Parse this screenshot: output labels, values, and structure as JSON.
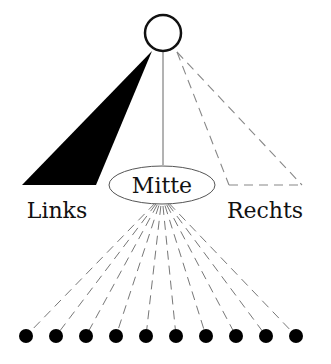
{
  "diagram": {
    "root": {
      "cx": 163,
      "cy": 33,
      "r": 19
    },
    "labels": {
      "left": "Links",
      "middle": "Mitte",
      "right": "Rechts"
    },
    "left_branch": {
      "style": "filled-triangle",
      "apex": [
        152,
        52
      ],
      "base": [
        [
          22,
          185
        ],
        [
          96,
          185
        ]
      ]
    },
    "middle_branch": {
      "style": "solid-line",
      "from": [
        163,
        52
      ],
      "to": [
        163,
        165
      ]
    },
    "right_branch": {
      "style": "dashed-triangle",
      "apex": [
        177,
        52
      ],
      "base": [
        [
          229,
          185
        ],
        [
          302,
          185
        ]
      ]
    },
    "middle_node": {
      "cx": 162,
      "cy": 185,
      "rx": 53,
      "ry": 20
    },
    "leaves": {
      "count": 10,
      "y": 336,
      "r": 7,
      "x": [
        26,
        56,
        86,
        116,
        146,
        176,
        206,
        236,
        266,
        296
      ]
    },
    "colors": {
      "stroke": "#111111",
      "dashed": "#888888",
      "fill": "#000000"
    }
  }
}
